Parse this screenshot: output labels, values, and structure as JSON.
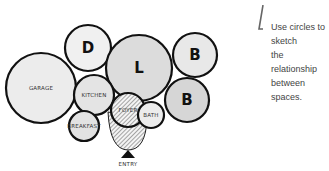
{
  "caption": {
    "lines": [
      "Use circles to sketch",
      "the relationship",
      "between spaces."
    ]
  },
  "spaces": [
    {
      "id": "garage",
      "label": "GARAGE",
      "cx": 41,
      "cy": 88,
      "r": 35,
      "fill": "#ececec",
      "shade": true
    },
    {
      "id": "dining",
      "label": "D",
      "cx": 88,
      "cy": 48,
      "r": 23,
      "fill": "#f0f0f0"
    },
    {
      "id": "living",
      "label": "L",
      "cx": 139,
      "cy": 68,
      "r": 33,
      "fill": "#dcdcdc",
      "shade": true
    },
    {
      "id": "bed1",
      "label": "B",
      "cx": 195,
      "cy": 55,
      "r": 22,
      "fill": "#e8e8e8"
    },
    {
      "id": "bed2",
      "label": "B",
      "cx": 187,
      "cy": 100,
      "r": 22,
      "fill": "#d6d6d6"
    },
    {
      "id": "kitchen",
      "label": "KITCHEN",
      "cx": 94,
      "cy": 95,
      "r": 20,
      "fill": "#e4e4e4"
    },
    {
      "id": "foyer",
      "label": "FOYER",
      "cx": 128,
      "cy": 110,
      "r": 17,
      "fill": "hatch"
    },
    {
      "id": "bath",
      "label": "BATH",
      "cx": 151,
      "cy": 115,
      "r": 13,
      "fill": "#ececec"
    },
    {
      "id": "breakfast",
      "label": "BREAKFAST",
      "cx": 84,
      "cy": 126,
      "r": 15,
      "fill": "#e2e2e2"
    }
  ],
  "entry": {
    "label": "ENTRY"
  },
  "colors": {
    "stroke": "#111111",
    "text": "#444444"
  }
}
